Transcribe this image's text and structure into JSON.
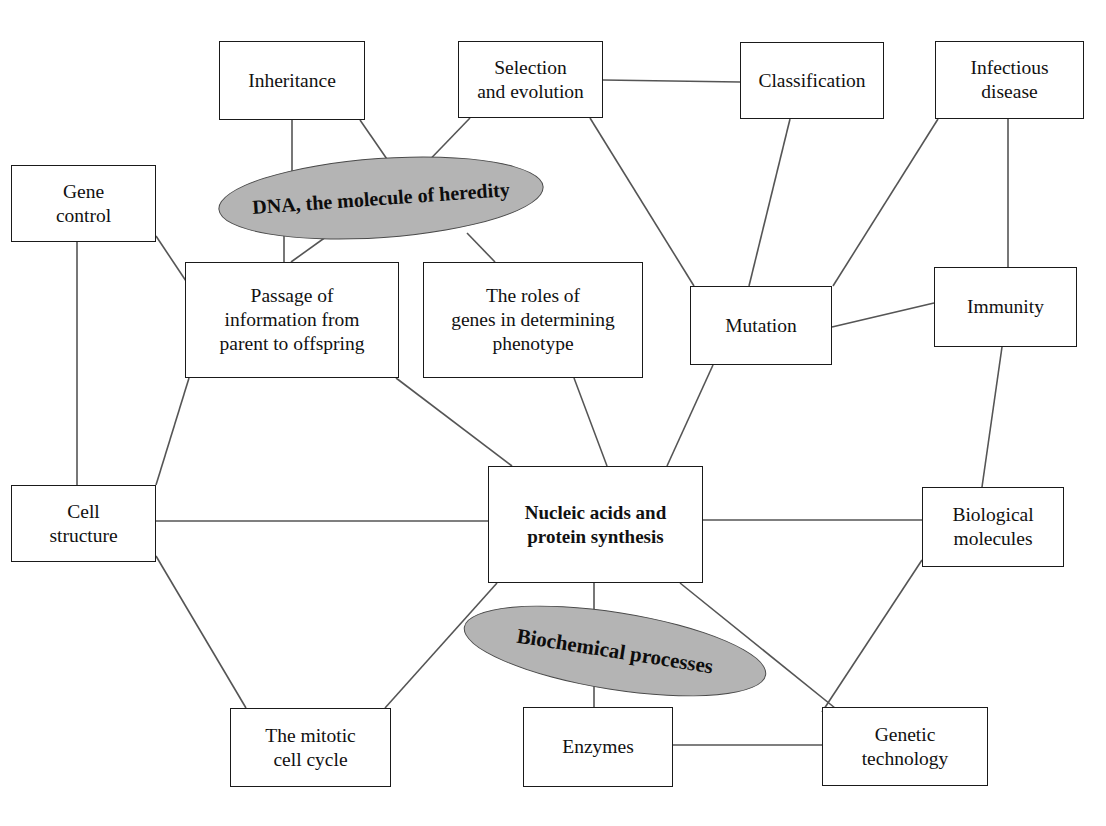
{
  "diagram": {
    "colors": {
      "box_border": "#1a1a1a",
      "box_fill": "#ffffff",
      "ellipse_fill": "#b4b4b4",
      "ellipse_border": "#4a4a4a",
      "edge": "#555555",
      "text": "#111111",
      "background": "#ffffff"
    },
    "boxes": [
      {
        "id": "inheritance",
        "label": "Inheritance",
        "x": 219,
        "y": 41,
        "w": 146,
        "h": 79,
        "bold": false,
        "font": 19.5
      },
      {
        "id": "selection",
        "label": "Selection\nand evolution",
        "x": 458,
        "y": 41,
        "w": 145,
        "h": 77,
        "bold": false,
        "font": 19.5
      },
      {
        "id": "classification",
        "label": "Classification",
        "x": 740,
        "y": 42,
        "w": 144,
        "h": 77,
        "bold": false,
        "font": 19.5
      },
      {
        "id": "infectious",
        "label": "Infectious\ndisease",
        "x": 935,
        "y": 41,
        "w": 149,
        "h": 78,
        "bold": false,
        "font": 19.5
      },
      {
        "id": "genecontrol",
        "label": "Gene\ncontrol",
        "x": 11,
        "y": 165,
        "w": 145,
        "h": 77,
        "bold": false,
        "font": 19.5
      },
      {
        "id": "passage",
        "label": "Passage of\ninformation from\nparent to offspring",
        "x": 185,
        "y": 262,
        "w": 214,
        "h": 116,
        "bold": false,
        "font": 19.5
      },
      {
        "id": "roles",
        "label": "The roles of\ngenes in determining\nphenotype",
        "x": 423,
        "y": 262,
        "w": 220,
        "h": 116,
        "bold": false,
        "font": 19.5
      },
      {
        "id": "mutation",
        "label": "Mutation",
        "x": 690,
        "y": 286,
        "w": 142,
        "h": 79,
        "bold": false,
        "font": 19.5
      },
      {
        "id": "immunity",
        "label": "Immunity",
        "x": 934,
        "y": 267,
        "w": 143,
        "h": 80,
        "bold": false,
        "font": 19.5
      },
      {
        "id": "cellstructure",
        "label": "Cell\nstructure",
        "x": 11,
        "y": 485,
        "w": 145,
        "h": 77,
        "bold": false,
        "font": 19.5
      },
      {
        "id": "nucleic",
        "label": "Nucleic acids and\nprotein synthesis",
        "x": 488,
        "y": 466,
        "w": 215,
        "h": 117,
        "bold": true,
        "font": 19
      },
      {
        "id": "biomolecules",
        "label": "Biological\nmolecules",
        "x": 922,
        "y": 487,
        "w": 142,
        "h": 80,
        "bold": false,
        "font": 19.5
      },
      {
        "id": "mitotic",
        "label": "The mitotic\ncell cycle",
        "x": 230,
        "y": 708,
        "w": 161,
        "h": 79,
        "bold": false,
        "font": 19.5
      },
      {
        "id": "enzymes",
        "label": "Enzymes",
        "x": 523,
        "y": 707,
        "w": 150,
        "h": 80,
        "bold": false,
        "font": 19.5
      },
      {
        "id": "genetictech",
        "label": "Genetic\ntechnology",
        "x": 822,
        "y": 707,
        "w": 166,
        "h": 79,
        "bold": false,
        "font": 19.5
      }
    ],
    "ellipses": [
      {
        "id": "dna",
        "label": "DNA, the molecule of heredity",
        "cx": 381,
        "cy": 198,
        "rx": 163,
        "ry": 40,
        "rotate": -4,
        "font": 20
      },
      {
        "id": "biochemical",
        "label": "Biochemical processes",
        "cx": 615,
        "cy": 651,
        "rx": 153,
        "ry": 39,
        "rotate": 9,
        "font": 21
      }
    ],
    "edges": [
      {
        "from": "inheritance",
        "to": "dna-area",
        "points": "292,120 292,232"
      },
      {
        "from": "inheritance",
        "to": "dnaright",
        "points": "360,120 400,178"
      },
      {
        "from": "selection",
        "to": "dna",
        "points": "470,118 415,175"
      },
      {
        "from": "selection",
        "to": "classification",
        "points": "603,80 740,82"
      },
      {
        "from": "selection",
        "to": "mutation",
        "points": "590,118 694,286"
      },
      {
        "from": "classification",
        "to": "mutation",
        "points": "790,119 749,286"
      },
      {
        "from": "infectious",
        "to": "mutation",
        "points": "938,119 833,286"
      },
      {
        "from": "infectious",
        "to": "immunity",
        "points": "1008,119 1008,267"
      },
      {
        "from": "mutation",
        "to": "immunity",
        "points": "832,327 934,303"
      },
      {
        "from": "immunity",
        "to": "biomolecules",
        "points": "1002,347 982,487"
      },
      {
        "from": "mutation",
        "to": "nucleic",
        "points": "713,365 667,466"
      },
      {
        "from": "genecontrol",
        "to": "cellstructure",
        "points": "77,242 77,485"
      },
      {
        "from": "genecontrol",
        "to": "passage",
        "points": "156,236 196,296"
      },
      {
        "from": "dna",
        "to": "passage",
        "points": "330,234 291,262"
      },
      {
        "from": "dna",
        "to": "passage2",
        "points": "284,232 284,262"
      },
      {
        "from": "dna",
        "to": "roles",
        "points": "467,233 495,262"
      },
      {
        "from": "passage",
        "to": "cellstructure",
        "points": "189,378 156,485"
      },
      {
        "from": "passage",
        "to": "nucleic",
        "points": "396,378 512,466"
      },
      {
        "from": "roles",
        "to": "nucleic",
        "points": "574,378 607,466"
      },
      {
        "from": "cellstructure",
        "to": "nucleic",
        "points": "156,521 488,521"
      },
      {
        "from": "cellstructure",
        "to": "mitotic",
        "points": "156,556 246,708"
      },
      {
        "from": "nucleic",
        "to": "mitotic",
        "points": "497,583 385,708"
      },
      {
        "from": "nucleic",
        "to": "biomolecules",
        "points": "703,520 922,520"
      },
      {
        "from": "nucleic",
        "to": "enzymes",
        "points": "594,583 594,710"
      },
      {
        "from": "nucleic",
        "to": "genetictech",
        "points": "680,583 835,708"
      },
      {
        "from": "biomolecules",
        "to": "genetictech",
        "points": "922,560 822,712"
      },
      {
        "from": "enzymes",
        "to": "genetictech",
        "points": "673,745 822,745"
      }
    ]
  }
}
